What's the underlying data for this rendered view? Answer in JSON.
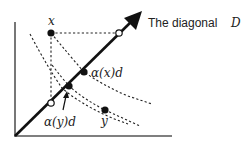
{
  "diagram": {
    "title_label": "The diagonal",
    "diagonal_symbol": "D",
    "point_x_label": "x",
    "point_y_label": "y",
    "alpha_x_label": "α(x)d",
    "alpha_y_label": "α(y)d"
  },
  "colors": {
    "ink": "#111111",
    "axis": "#555555",
    "background": "#ffffff"
  }
}
